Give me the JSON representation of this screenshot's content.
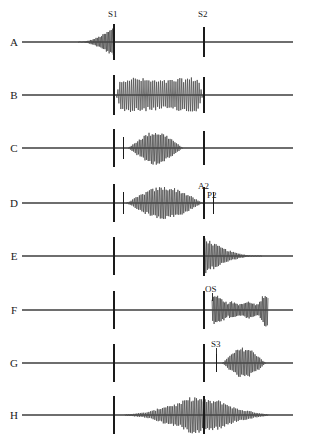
{
  "figure": {
    "title": "",
    "width": 310,
    "height": 440,
    "background": "#ffffff",
    "trace_color": "#4a4a4a",
    "baseline_color": "#6e6e6e",
    "marker_color": "#1a1a1a",
    "text_color": "#1a1a1a"
  },
  "markers": {
    "s1": {
      "label": "S1",
      "x": 114,
      "label_x": 108,
      "label_y": 17
    },
    "s2": {
      "label": "S2",
      "x": 204,
      "label_x": 198,
      "label_y": 17
    },
    "a2": {
      "label": "A2",
      "x": 204,
      "label_x": 198,
      "label_y": 189
    },
    "p2": {
      "label": "P2",
      "x": 213,
      "label_x": 207,
      "label_y": 198
    },
    "os": {
      "label": "OS",
      "x": 212,
      "label_x": 205,
      "label_y": 292
    },
    "s3": {
      "label": "S3",
      "x": 216,
      "label_x": 211,
      "label_y": 347
    }
  },
  "rows": [
    {
      "label": "A",
      "label_x": 14,
      "baseline_y": 42,
      "baseline_x0": 22,
      "baseline_x1": 293,
      "description": "presystolic-crescendo-murmur-into-S1",
      "heart_sounds": [
        {
          "name": "S1",
          "x": 114,
          "half_height": 18
        },
        {
          "name": "S2",
          "x": 204,
          "half_height": 15
        }
      ],
      "murmurs": [
        {
          "shape": "crescendo",
          "x_start": 78,
          "x_end": 114,
          "peak_amp": 14,
          "cycles": 26
        }
      ]
    },
    {
      "label": "B",
      "label_x": 14,
      "baseline_y": 95,
      "baseline_x0": 22,
      "baseline_x1": 293,
      "description": "holosystolic-plateau-murmur",
      "heart_sounds": [
        {
          "name": "S1",
          "x": 114,
          "half_height": 20
        },
        {
          "name": "S2",
          "x": 204,
          "half_height": 18
        }
      ],
      "murmurs": [
        {
          "shape": "plateau",
          "x_start": 116,
          "x_end": 203,
          "peak_amp": 16,
          "cycles": 45
        }
      ]
    },
    {
      "label": "C",
      "label_x": 14,
      "baseline_y": 148,
      "baseline_x0": 22,
      "baseline_x1": 293,
      "description": "ejection-click-then-diamond-systolic-murmur",
      "heart_sounds": [
        {
          "name": "S1",
          "x": 114,
          "half_height": 19
        },
        {
          "name": "click",
          "x": 123,
          "half_height": 11
        },
        {
          "name": "S2",
          "x": 204,
          "half_height": 17
        }
      ],
      "murmurs": [
        {
          "shape": "diamond",
          "x_start": 128,
          "x_end": 183,
          "peak_amp": 15,
          "cycles": 34
        }
      ]
    },
    {
      "label": "D",
      "label_x": 14,
      "baseline_y": 203,
      "baseline_x0": 22,
      "baseline_x1": 293,
      "description": "diamond-systolic-murmur-with-split-second-sound-A2-P2",
      "heart_sounds": [
        {
          "name": "S1",
          "x": 114,
          "half_height": 19
        },
        {
          "name": "click",
          "x": 123,
          "half_height": 11
        },
        {
          "name": "A2",
          "x": 204,
          "half_height": 16
        },
        {
          "name": "P2",
          "x": 213,
          "half_height": 11
        }
      ],
      "murmurs": [
        {
          "shape": "diamond",
          "x_start": 126,
          "x_end": 203,
          "peak_amp": 15,
          "cycles": 46
        }
      ]
    },
    {
      "label": "E",
      "label_x": 14,
      "baseline_y": 256,
      "baseline_x0": 22,
      "baseline_x1": 293,
      "description": "early-diastolic-decrescendo-murmur",
      "heart_sounds": [
        {
          "name": "S1",
          "x": 114,
          "half_height": 19
        },
        {
          "name": "S2",
          "x": 204,
          "half_height": 20
        }
      ],
      "murmurs": [
        {
          "shape": "decrescendo",
          "x_start": 205,
          "x_end": 262,
          "peak_amp": 17,
          "cycles": 36
        }
      ]
    },
    {
      "label": "F",
      "label_x": 14,
      "baseline_y": 310,
      "baseline_x0": 22,
      "baseline_x1": 293,
      "description": "opening-snap-with-mid-diastolic-rumble-and-presystolic-accentuation",
      "heart_sounds": [
        {
          "name": "S1",
          "x": 114,
          "half_height": 19
        },
        {
          "name": "S2",
          "x": 204,
          "half_height": 19
        }
      ],
      "murmurs": [
        {
          "shape": "rumble-crescendo",
          "x_start": 212,
          "x_end": 268,
          "peak_amp": 16,
          "cycles": 40
        }
      ]
    },
    {
      "label": "G",
      "label_x": 14,
      "baseline_y": 363,
      "baseline_x0": 22,
      "baseline_x1": 293,
      "description": "third-heart-sound-with-mid-diastolic-diamond-rumble",
      "heart_sounds": [
        {
          "name": "S1",
          "x": 114,
          "half_height": 19
        },
        {
          "name": "S2",
          "x": 204,
          "half_height": 19
        },
        {
          "name": "S3",
          "x": 216,
          "half_height": 9
        }
      ],
      "murmurs": [
        {
          "shape": "diamond",
          "x_start": 222,
          "x_end": 266,
          "peak_amp": 14,
          "cycles": 28
        }
      ]
    },
    {
      "label": "H",
      "label_x": 14,
      "baseline_y": 415,
      "baseline_x0": 22,
      "baseline_x1": 293,
      "description": "continuous-machinery-murmur-peaking-around-S2",
      "heart_sounds": [
        {
          "name": "S1",
          "x": 114,
          "half_height": 19
        },
        {
          "name": "S2",
          "x": 204,
          "half_height": 19
        }
      ],
      "murmurs": [
        {
          "shape": "continuous",
          "x_start": 125,
          "x_end": 268,
          "peak_amp": 17,
          "cycles": 84,
          "peak_x": 195
        }
      ]
    }
  ]
}
